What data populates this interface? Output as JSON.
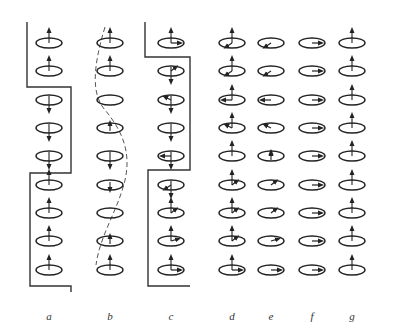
{
  "figure": {
    "type": "spin-precession-diagram",
    "panels": [
      {
        "id": "a",
        "label": "a"
      },
      {
        "id": "b",
        "label": "b"
      },
      {
        "id": "c",
        "label": "c"
      },
      {
        "id": "d",
        "label": "d"
      },
      {
        "id": "e",
        "label": "e"
      },
      {
        "id": "f",
        "label": "f"
      },
      {
        "id": "g",
        "label": "g"
      }
    ],
    "rows": 9,
    "columns": {
      "a": {
        "x": 49,
        "vertical": [
          "up",
          "up",
          "down",
          "down",
          "down",
          "up",
          "up",
          "up",
          "up"
        ],
        "horizontal": [
          null,
          null,
          null,
          null,
          null,
          null,
          null,
          null,
          null
        ],
        "boundary": "wall"
      },
      "b": {
        "x": 110,
        "vertical": [
          "up",
          "up",
          "none",
          "up-small",
          "down",
          "down-small",
          "none",
          "up-small",
          "up"
        ],
        "horizontal": [
          null,
          null,
          null,
          null,
          null,
          null,
          null,
          null,
          null
        ],
        "boundary": "dashed-curve"
      },
      "c": {
        "x": 171,
        "vertical": [
          "up",
          "down",
          "down",
          "down",
          "down",
          "down",
          "up",
          "up",
          "up"
        ],
        "horizontal": [
          "right",
          "up-right",
          "up-left",
          "none",
          "left",
          "down-left",
          "up-right",
          "right-up",
          "right"
        ],
        "boundary": "wall"
      },
      "d": {
        "x": 232,
        "vertical": [
          "up",
          "up",
          "up",
          "up",
          "up",
          "up",
          "up",
          "up",
          "up"
        ],
        "horizontal": [
          "down-left",
          "down-left",
          "left",
          "up-left",
          "none",
          "up-right",
          "up-right",
          "up-right",
          "right"
        ]
      },
      "e": {
        "x": 271,
        "vertical": [
          "none",
          "none",
          "none",
          "none",
          "small-up",
          "none",
          "none",
          "none",
          "none"
        ],
        "horizontal": [
          "down-left",
          "down-left",
          "left",
          "up-left",
          "up",
          "up-right",
          "up-right",
          "right-up",
          "right"
        ]
      },
      "f": {
        "x": 312,
        "vertical": [
          "none",
          "none",
          "none",
          "none",
          "none",
          "none",
          "none",
          "none",
          "none"
        ],
        "horizontal": [
          "right",
          "right",
          "right",
          "right",
          "right",
          "right",
          "right",
          "right",
          "right"
        ]
      },
      "g": {
        "x": 352,
        "vertical": [
          "up",
          "up",
          "up",
          "up",
          "up",
          "up",
          "up",
          "up",
          "up"
        ],
        "horizontal": [
          null,
          null,
          null,
          null,
          null,
          null,
          null,
          null,
          null
        ]
      }
    },
    "row_y": [
      43,
      71,
      100,
      128,
      156,
      185,
      213,
      241,
      270
    ],
    "colors": {
      "ink": "#222222",
      "background": "#ffffff"
    }
  }
}
